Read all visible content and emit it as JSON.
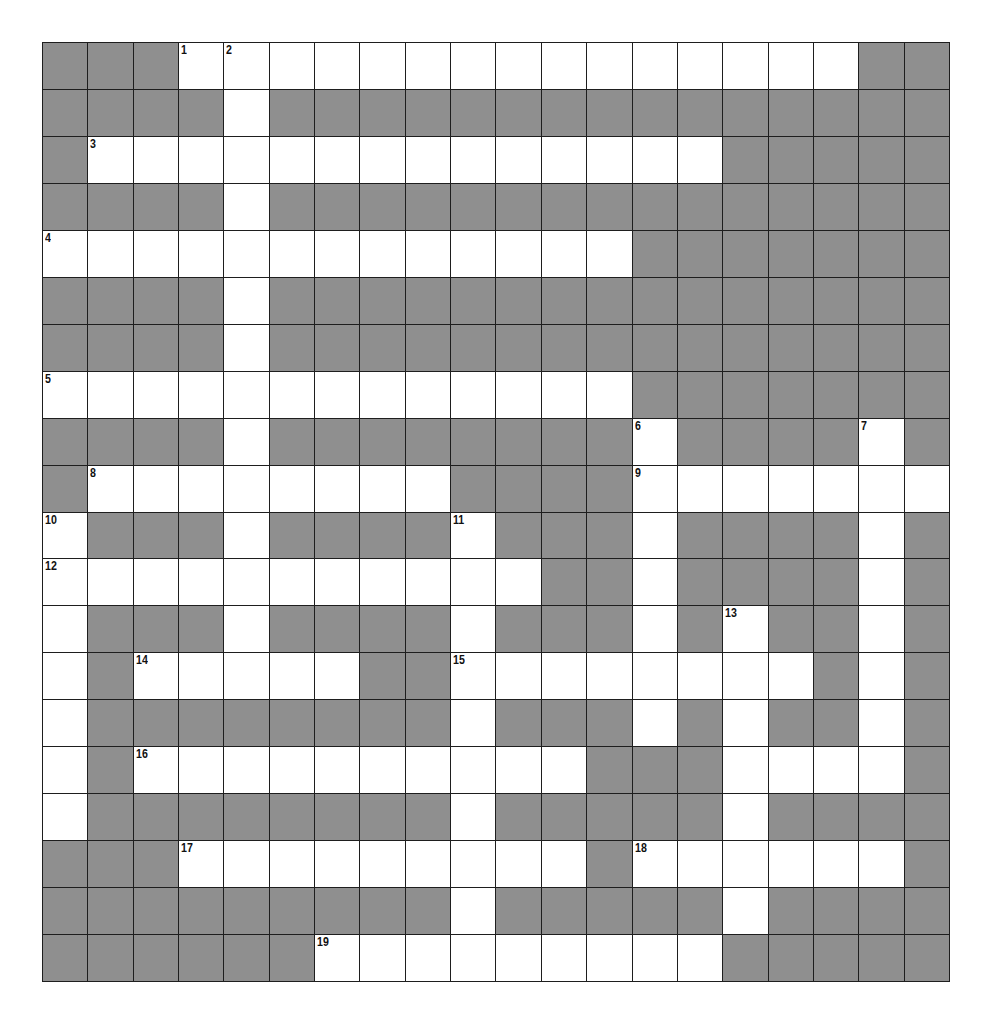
{
  "title": {
    "text": "",
    "clipped": true
  },
  "colors": {
    "block": "#8f8f8f",
    "open": "#ffffff",
    "gridline": "#1e1e1e",
    "number": "#111111"
  },
  "puzzle": {
    "rows": 20,
    "cols": 20,
    "layout": [
      "###...............##",
      "####.###############",
      "#..............#####",
      "####.###############",
      ".............#######",
      "####.###############",
      "####.###############",
      ".............#######",
      "####.########.####.#",
      "#........####.......",
      ".###.####.###.####.#",
      "...........##.####.#",
      ".###.####.###.#.##.#",
      ".#.....##........#.#",
      ".########.###.#.##.#",
      ".#..........###....#",
      ".########.#####.####",
      "###.........#......#",
      "#########.#####.####",
      "######.........#####"
    ],
    "numbers": [
      {
        "n": "1",
        "row": 0,
        "col": 3
      },
      {
        "n": "2",
        "row": 0,
        "col": 4
      },
      {
        "n": "3",
        "row": 2,
        "col": 1
      },
      {
        "n": "4",
        "row": 4,
        "col": 0
      },
      {
        "n": "5",
        "row": 7,
        "col": 0
      },
      {
        "n": "6",
        "row": 8,
        "col": 13
      },
      {
        "n": "7",
        "row": 8,
        "col": 18
      },
      {
        "n": "8",
        "row": 9,
        "col": 1
      },
      {
        "n": "9",
        "row": 9,
        "col": 13
      },
      {
        "n": "10",
        "row": 10,
        "col": 0
      },
      {
        "n": "11",
        "row": 10,
        "col": 9
      },
      {
        "n": "12",
        "row": 11,
        "col": 0
      },
      {
        "n": "13",
        "row": 12,
        "col": 15
      },
      {
        "n": "14",
        "row": 13,
        "col": 2
      },
      {
        "n": "15",
        "row": 13,
        "col": 9
      },
      {
        "n": "16",
        "row": 15,
        "col": 2
      },
      {
        "n": "17",
        "row": 17,
        "col": 3
      },
      {
        "n": "18",
        "row": 17,
        "col": 13
      },
      {
        "n": "19",
        "row": 19,
        "col": 6
      }
    ],
    "entries": {}
  }
}
